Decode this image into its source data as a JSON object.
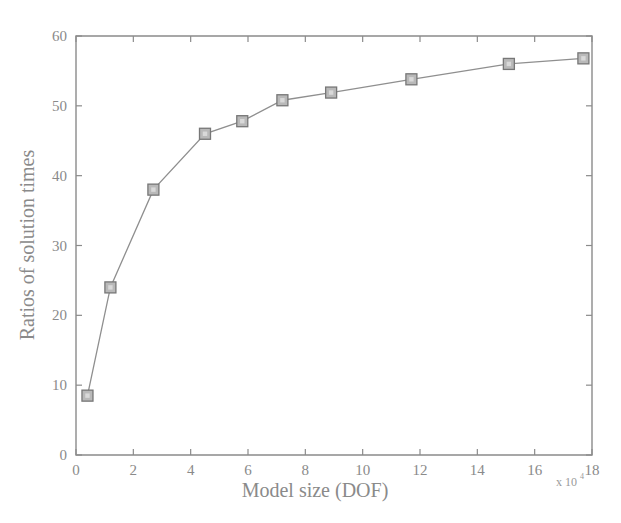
{
  "chart_data": {
    "type": "line",
    "title": "",
    "subtitle": "",
    "xlabel": "Model size (DOF)",
    "ylabel": "Ratios of solution times",
    "x_multiplier_text": "x 10",
    "x_multiplier_exponent": "4",
    "xlim": [
      0,
      18
    ],
    "ylim": [
      0,
      60
    ],
    "xticks": [
      0,
      2,
      4,
      6,
      8,
      10,
      12,
      14,
      16,
      18
    ],
    "xtick_labels": [
      "0",
      "2",
      "4",
      "6",
      "8",
      "10",
      "12",
      "14",
      "16",
      "18"
    ],
    "yticks": [
      0,
      10,
      20,
      30,
      40,
      50,
      60
    ],
    "ytick_labels": [
      "0",
      "10",
      "20",
      "30",
      "40",
      "50",
      "60"
    ],
    "grid": false,
    "legend": null,
    "legend_position": "none",
    "marker": "square",
    "line_color": "#8f8f8f",
    "marker_color": "#b9b9b9",
    "marker_edge_color": "#777777",
    "axis_color": "#8b8b8b",
    "background_color": "#ffffff",
    "series": [
      {
        "name": "Ratios of solution times",
        "x": [
          0.4,
          1.2,
          2.7,
          4.5,
          5.8,
          7.2,
          8.9,
          11.7,
          15.1,
          17.7
        ],
        "values": [
          8.5,
          24.0,
          38.0,
          46.0,
          47.8,
          50.8,
          51.9,
          53.8,
          56.0,
          56.8
        ]
      }
    ],
    "annotations": []
  }
}
